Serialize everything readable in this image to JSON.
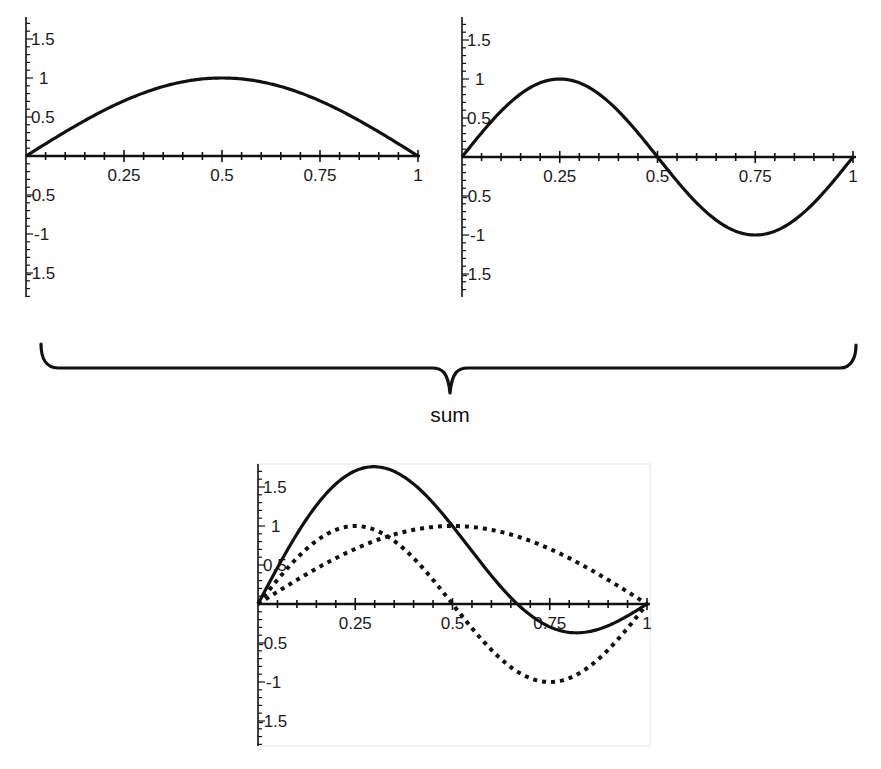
{
  "caption": "sum",
  "chart_data": [
    {
      "type": "line",
      "title": "",
      "xlabel": "",
      "ylabel": "",
      "xlim": [
        0,
        1
      ],
      "ylim": [
        -1.8,
        1.8
      ],
      "grid": false,
      "x_ticks": [
        "0.25",
        "0.5",
        "0.75",
        "1"
      ],
      "y_ticks": [
        "1.5",
        "1",
        "0.5",
        "-0.5",
        "-1",
        "-1.5"
      ],
      "series": [
        {
          "name": "sin(pi x)",
          "style": "solid",
          "x": [
            0,
            0.1,
            0.2,
            0.25,
            0.3,
            0.4,
            0.5,
            0.6,
            0.7,
            0.75,
            0.8,
            0.9,
            1.0
          ],
          "values": [
            0,
            0.31,
            0.59,
            0.71,
            0.81,
            0.95,
            1.0,
            0.95,
            0.81,
            0.71,
            0.59,
            0.31,
            0
          ]
        }
      ]
    },
    {
      "type": "line",
      "title": "",
      "xlabel": "",
      "ylabel": "",
      "xlim": [
        0,
        1
      ],
      "ylim": [
        -1.8,
        1.8
      ],
      "grid": false,
      "x_ticks": [
        "0.25",
        "0.5",
        "0.75",
        "1"
      ],
      "y_ticks": [
        "1.5",
        "1",
        "0.5",
        "-0.5",
        "-1",
        "-1.5"
      ],
      "series": [
        {
          "name": "sin(2 pi x)",
          "style": "solid",
          "x": [
            0,
            0.1,
            0.2,
            0.25,
            0.3,
            0.4,
            0.5,
            0.6,
            0.7,
            0.75,
            0.8,
            0.9,
            1.0
          ],
          "values": [
            0,
            0.59,
            0.95,
            1.0,
            0.95,
            0.59,
            0,
            -0.59,
            -0.95,
            -1.0,
            -0.95,
            -0.59,
            0
          ]
        }
      ]
    },
    {
      "type": "line",
      "title": "",
      "xlabel": "",
      "ylabel": "",
      "xlim": [
        0,
        1
      ],
      "ylim": [
        -1.8,
        1.8
      ],
      "grid": false,
      "x_ticks": [
        "0.25",
        "0.5",
        "0.75",
        "1"
      ],
      "y_ticks": [
        "1.5",
        "1",
        "0.5",
        "-0.5",
        "-1",
        "-1.5"
      ],
      "annotation": "sum",
      "series": [
        {
          "name": "sin(pi x) + sin(2 pi x)",
          "style": "solid",
          "x": [
            0,
            0.1,
            0.2,
            0.25,
            0.3,
            0.4,
            0.5,
            0.6,
            0.7,
            0.75,
            0.8,
            0.9,
            1.0
          ],
          "values": [
            0,
            0.9,
            1.54,
            1.71,
            1.76,
            1.54,
            1.0,
            0.36,
            -0.14,
            -0.29,
            -0.36,
            -0.28,
            0
          ]
        },
        {
          "name": "sin(pi x)",
          "style": "dotted",
          "x": [
            0,
            0.1,
            0.2,
            0.25,
            0.3,
            0.4,
            0.5,
            0.6,
            0.7,
            0.75,
            0.8,
            0.9,
            1.0
          ],
          "values": [
            0,
            0.31,
            0.59,
            0.71,
            0.81,
            0.95,
            1.0,
            0.95,
            0.81,
            0.71,
            0.59,
            0.31,
            0
          ]
        },
        {
          "name": "sin(2 pi x)",
          "style": "dotted",
          "x": [
            0,
            0.1,
            0.2,
            0.25,
            0.3,
            0.4,
            0.5,
            0.6,
            0.7,
            0.75,
            0.8,
            0.9,
            1.0
          ],
          "values": [
            0,
            0.59,
            0.95,
            1.0,
            0.95,
            0.59,
            0,
            -0.59,
            -0.95,
            -1.0,
            -0.95,
            -0.59,
            0
          ]
        }
      ]
    }
  ],
  "plots": [
    {
      "id": "plot-sin-pi-x",
      "x_ticks": [
        "0.25",
        "0.5",
        "0.75",
        "1"
      ],
      "y_ticks": [
        "1.5",
        "1",
        "0.5",
        "-0.5",
        "-1",
        "-1.5"
      ]
    },
    {
      "id": "plot-sin-2pi-x",
      "x_ticks": [
        "0.25",
        "0.5",
        "0.75",
        "1"
      ],
      "y_ticks": [
        "1.5",
        "1",
        "0.5",
        "-0.5",
        "-1",
        "-1.5"
      ]
    },
    {
      "id": "plot-sum",
      "x_ticks": [
        "0.25",
        "0.5",
        "0.75",
        "1"
      ],
      "y_ticks": [
        "1.5",
        "1",
        "0.5",
        "-0.5",
        "-1",
        "-1.5"
      ]
    }
  ],
  "colors": {
    "line": "#111111",
    "frame": "#e6e6e6",
    "background": "#ffffff"
  }
}
